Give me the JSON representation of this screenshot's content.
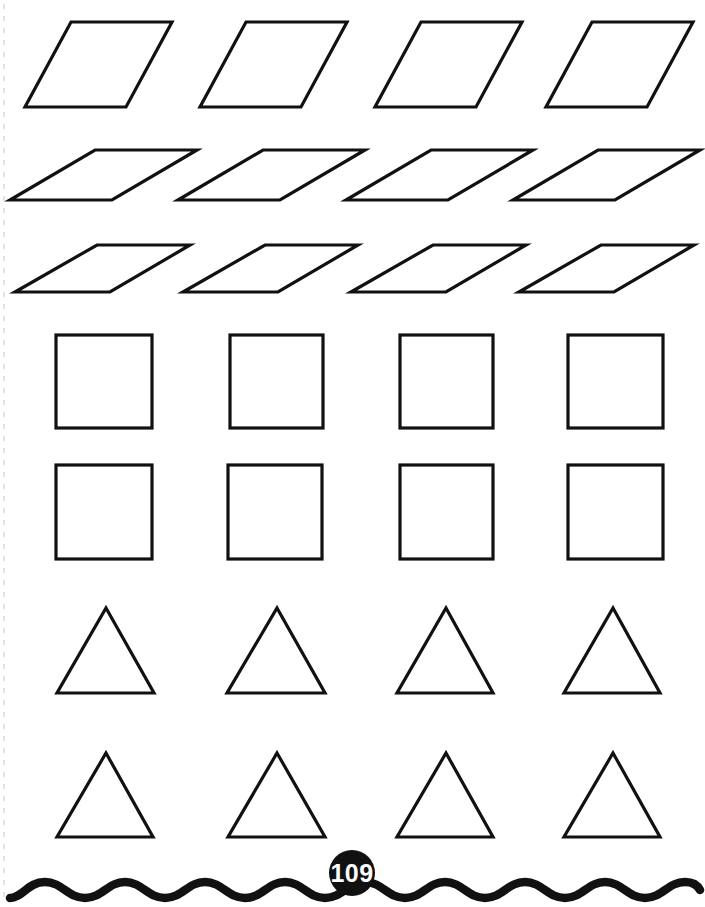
{
  "page": {
    "width": 705,
    "height": 907,
    "background_color": "#ffffff",
    "ink_color": "#111111",
    "page_number": "109",
    "page_number_badge_color": "#111111",
    "page_number_text_color": "#ffffff",
    "perforation_color": "#cfcfcf"
  },
  "worksheet": {
    "title": "Geometric shapes cut-out worksheet",
    "rows": [
      {
        "name": "parallelograms-steep-row",
        "shape_type": "parallelogram",
        "count": 4,
        "shapes": [
          {
            "label": "parallelogram-steep-1",
            "points": "71,22 172,22 126,107 25,107"
          },
          {
            "label": "parallelogram-steep-2",
            "points": "246,22 347,22 301,107 200,107"
          },
          {
            "label": "parallelogram-steep-3",
            "points": "421,22 522,22 476,107 375,107"
          },
          {
            "label": "parallelogram-steep-4",
            "points": "592,22 693,22 647,107 546,107"
          }
        ]
      },
      {
        "name": "parallelograms-flat-row-1",
        "shape_type": "parallelogram",
        "count": 4,
        "shapes": [
          {
            "label": "parallelogram-flat-1-1",
            "points": "95,150 197,150 112,200 10,200"
          },
          {
            "label": "parallelogram-flat-1-2",
            "points": "263,150 365,150 280,200 178,200"
          },
          {
            "label": "parallelogram-flat-1-3",
            "points": "431,150 533,150 448,200 346,200"
          },
          {
            "label": "parallelogram-flat-1-4",
            "points": "598,150 700,150 615,200 513,200"
          }
        ]
      },
      {
        "name": "parallelograms-flat-row-2",
        "shape_type": "parallelogram",
        "count": 4,
        "shapes": [
          {
            "label": "parallelogram-flat-2-1",
            "points": "97,245 190,245 110,292 15,292"
          },
          {
            "label": "parallelogram-flat-2-2",
            "points": "265,245 358,245 278,292 183,292"
          },
          {
            "label": "parallelogram-flat-2-3",
            "points": "433,245 526,245 446,292 351,292"
          },
          {
            "label": "parallelogram-flat-2-4",
            "points": "601,245 694,245 614,292 519,292"
          }
        ]
      },
      {
        "name": "squares-row-1",
        "shape_type": "square",
        "count": 4,
        "shapes": [
          {
            "label": "square-1-1",
            "x": 56,
            "y": 335,
            "width": 96,
            "height": 93
          },
          {
            "label": "square-1-2",
            "x": 230,
            "y": 335,
            "width": 93,
            "height": 93
          },
          {
            "label": "square-1-3",
            "x": 400,
            "y": 335,
            "width": 93,
            "height": 93
          },
          {
            "label": "square-1-4",
            "x": 568,
            "y": 335,
            "width": 95,
            "height": 93
          }
        ]
      },
      {
        "name": "squares-row-2",
        "shape_type": "square",
        "count": 4,
        "shapes": [
          {
            "label": "square-2-1",
            "x": 56,
            "y": 465,
            "width": 96,
            "height": 94
          },
          {
            "label": "square-2-2",
            "x": 228,
            "y": 465,
            "width": 94,
            "height": 94
          },
          {
            "label": "square-2-3",
            "x": 400,
            "y": 465,
            "width": 93,
            "height": 94
          },
          {
            "label": "square-2-4",
            "x": 568,
            "y": 465,
            "width": 95,
            "height": 94
          }
        ]
      },
      {
        "name": "triangles-row-1",
        "shape_type": "triangle",
        "count": 4,
        "shapes": [
          {
            "label": "triangle-1-1",
            "points": "106,608 154,693 57,693"
          },
          {
            "label": "triangle-1-2",
            "points": "277,608 325,693 227,693"
          },
          {
            "label": "triangle-1-3",
            "points": "446,608 493,693 397,693"
          },
          {
            "label": "triangle-1-4",
            "points": "613,608 660,693 564,693"
          }
        ]
      },
      {
        "name": "triangles-row-2",
        "shape_type": "triangle",
        "count": 4,
        "shapes": [
          {
            "label": "triangle-2-1",
            "points": "106,753 153,837 57,837"
          },
          {
            "label": "triangle-2-2",
            "points": "277,753 325,837 228,837"
          },
          {
            "label": "triangle-2-3",
            "points": "446,753 493,837 397,837"
          },
          {
            "label": "triangle-2-4",
            "points": "613,753 660,837 564,837"
          }
        ]
      }
    ],
    "footer": {
      "wave_path": "M 10,898 C 22,898 28,882 45,882 C 62,882 68,898 85,898 C 102,898 108,882 125,882 C 142,882 148,898 165,898 C 182,898 188,882 205,882 C 222,882 228,898 245,898 C 262,898 268,882 285,882 C 302,882 308,898 325,898 C 342,898 348,882 365,882 C 382,882 388,898 405,898 C 422,898 428,882 445,882 C 462,882 468,898 485,898 C 502,898 508,882 525,882 C 542,882 548,898 565,898 C 582,898 588,882 605,882 C 622,882 628,898 645,898 C 662,898 668,882 685,882 C 694,882 698,886 700,890",
      "badge_center_x": 352,
      "badge_center_y": 873,
      "badge_radius": 23
    },
    "perforation": {
      "x": 4,
      "y_start": 4,
      "y_end": 900
    }
  }
}
